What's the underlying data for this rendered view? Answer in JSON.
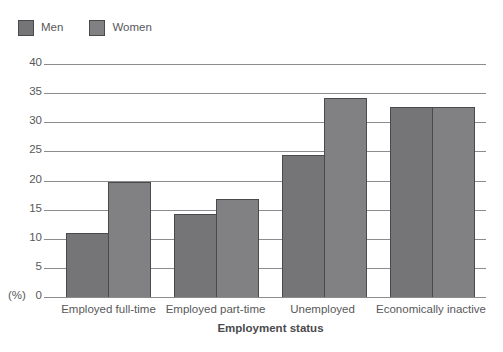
{
  "legend": {
    "items": [
      {
        "label": "Men",
        "color": "#757577",
        "icon": "legend-swatch-icon"
      },
      {
        "label": "Women",
        "color": "#818183",
        "icon": "legend-swatch-icon"
      }
    ]
  },
  "axes": {
    "y_unit_label": "(%)",
    "y_ticks": [
      "40",
      "35",
      "30",
      "25",
      "20",
      "15",
      "10",
      "5",
      "0"
    ],
    "x_title": "Employment status"
  },
  "chart_data": {
    "type": "bar",
    "title": "",
    "xlabel": "Employment status",
    "ylabel": "(%)",
    "ylim": [
      0,
      40
    ],
    "ytick_step": 5,
    "grid": true,
    "legend_position": "top-left",
    "categories": [
      "Employed full-time",
      "Employed part-time",
      "Unemployed",
      "Economically inactive"
    ],
    "series": [
      {
        "name": "Men",
        "color": "#757577",
        "values": [
          11.0,
          14.3,
          24.3,
          32.7
        ]
      },
      {
        "name": "Women",
        "color": "#818183",
        "values": [
          19.7,
          16.8,
          34.2,
          32.7
        ]
      }
    ]
  }
}
